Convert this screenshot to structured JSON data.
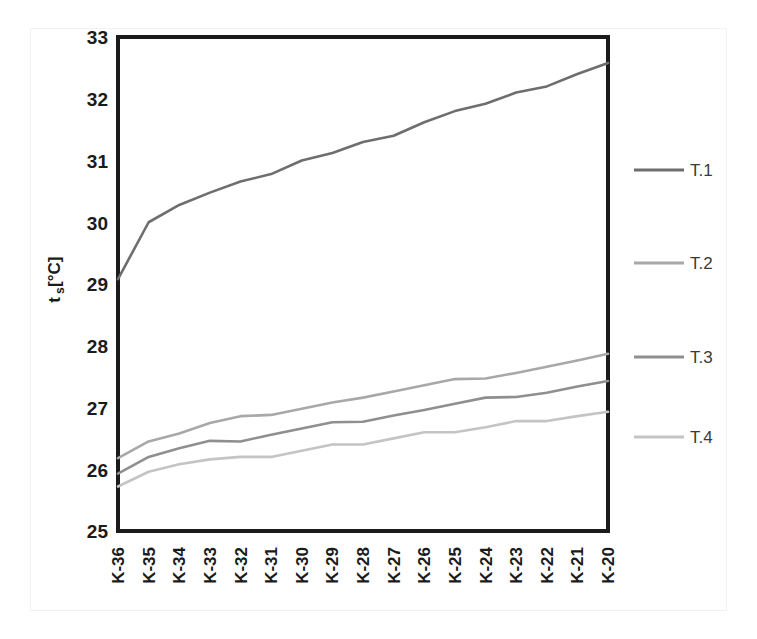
{
  "chart_data": {
    "type": "line",
    "title": "",
    "xlabel": "",
    "ylabel": "t_s [°C]",
    "ylabel_main": "t",
    "ylabel_sub": "s",
    "ylabel_unit": " [°C]",
    "ylim": [
      25,
      33
    ],
    "ytick_labels": [
      "33",
      "32",
      "31",
      "30",
      "29",
      "28",
      "27",
      "26",
      "25"
    ],
    "yticks": [
      33,
      32,
      31,
      30,
      29,
      28,
      27,
      26,
      25
    ],
    "grid": false,
    "legend_position": "right",
    "categories": [
      "K-36",
      "K-35",
      "K-34",
      "K-33",
      "K-32",
      "K-31",
      "K-30",
      "K-29",
      "K-28",
      "K-27",
      "K-26",
      "K-25",
      "K-24",
      "K-23",
      "K-22",
      "K-21",
      "K-20"
    ],
    "series": [
      {
        "name": "T.1",
        "color": "#6e6e6e",
        "values": [
          29.08,
          30.0,
          30.28,
          30.48,
          30.66,
          30.78,
          31.0,
          31.12,
          31.3,
          31.4,
          31.62,
          31.8,
          31.92,
          32.1,
          32.2,
          32.4,
          32.58
        ]
      },
      {
        "name": "T.2",
        "color": "#a8a8a8",
        "values": [
          26.18,
          26.45,
          26.58,
          26.75,
          26.86,
          26.88,
          26.98,
          27.08,
          27.16,
          27.26,
          27.36,
          27.46,
          27.47,
          27.56,
          27.66,
          27.76,
          27.87
        ]
      },
      {
        "name": "T.3",
        "color": "#8f8f8f",
        "values": [
          25.93,
          26.2,
          26.34,
          26.46,
          26.45,
          26.56,
          26.66,
          26.76,
          26.77,
          26.87,
          26.96,
          27.06,
          27.16,
          27.17,
          27.24,
          27.34,
          27.43
        ]
      },
      {
        "name": "T.4",
        "color": "#c4c4c4",
        "values": [
          25.72,
          25.96,
          26.08,
          26.16,
          26.2,
          26.2,
          26.3,
          26.4,
          26.4,
          26.5,
          26.6,
          26.6,
          26.68,
          26.78,
          26.78,
          26.86,
          26.93
        ]
      }
    ]
  },
  "legend": {
    "items": [
      {
        "label": "T.1",
        "color": "#6e6e6e"
      },
      {
        "label": "T.2",
        "color": "#a8a8a8"
      },
      {
        "label": "T.3",
        "color": "#8f8f8f"
      },
      {
        "label": "T.4",
        "color": "#c4c4c4"
      }
    ]
  },
  "axes": {
    "y_axis_title": "ts [°C]",
    "frame_color": "#1b1b1b"
  }
}
